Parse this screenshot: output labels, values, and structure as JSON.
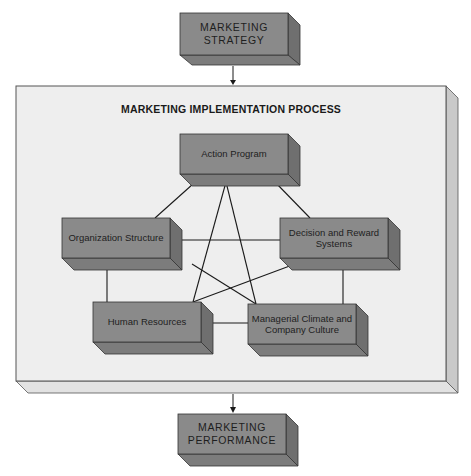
{
  "diagram": {
    "top_box": {
      "label_line1": "MARKETING",
      "label_line2": "STRATEGY"
    },
    "bottom_box": {
      "label_line1": "MARKETING",
      "label_line2": "PERFORMANCE"
    },
    "frame": {
      "title": "MARKETING IMPLEMENTATION PROCESS"
    },
    "nodes": [
      {
        "id": "action",
        "line1": "Action Program",
        "line2": ""
      },
      {
        "id": "org",
        "line1": "Organization Structure",
        "line2": ""
      },
      {
        "id": "decision",
        "line1": "Decision and Reward",
        "line2": "Systems"
      },
      {
        "id": "human",
        "line1": "Human Resources",
        "line2": ""
      },
      {
        "id": "managerial",
        "line1": "Managerial Climate and",
        "line2": "Company Culture"
      }
    ],
    "edges": [
      [
        "action",
        "org"
      ],
      [
        "action",
        "decision"
      ],
      [
        "action",
        "human"
      ],
      [
        "action",
        "managerial"
      ],
      [
        "org",
        "decision"
      ],
      [
        "org",
        "human"
      ],
      [
        "org",
        "managerial"
      ],
      [
        "decision",
        "human"
      ],
      [
        "decision",
        "managerial"
      ],
      [
        "human",
        "managerial"
      ],
      [
        "strategy",
        "frame"
      ],
      [
        "frame",
        "performance"
      ]
    ],
    "colors": {
      "box_front": "#8a8a8a",
      "box_side": "#6f6f6f",
      "box_bottom": "#7c7c7c",
      "frame_front": "#eeeeee",
      "frame_side": "#c9c9c9",
      "line": "#1a1a1a"
    }
  }
}
